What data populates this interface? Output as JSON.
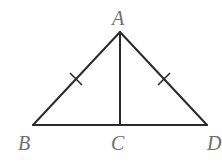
{
  "diagram": {
    "type": "geometry",
    "points": {
      "A": {
        "label": "A",
        "x": 120,
        "y": 32
      },
      "B": {
        "label": "B",
        "x": 33,
        "y": 125
      },
      "C": {
        "label": "C",
        "x": 120,
        "y": 125
      },
      "D": {
        "label": "D",
        "x": 207,
        "y": 125
      }
    },
    "segments": [
      {
        "from": "A",
        "to": "B",
        "tick_marks": 1
      },
      {
        "from": "A",
        "to": "D",
        "tick_marks": 1
      },
      {
        "from": "B",
        "to": "D",
        "tick_marks": 0
      },
      {
        "from": "A",
        "to": "C",
        "tick_marks": 0
      }
    ],
    "labels": {
      "A": "A",
      "B": "B",
      "C": "C",
      "D": "D"
    },
    "colors": {
      "line": "#2a2a2a",
      "label": "#6e6e6e",
      "background": "#ffffff"
    }
  }
}
